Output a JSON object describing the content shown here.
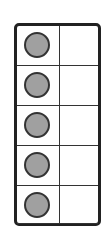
{
  "ten_frame": {
    "columns": 2,
    "rows": 5,
    "filled_count": 5,
    "counter_color": "#a0a0a0",
    "frame_color": "#222222",
    "cells": [
      {
        "row": 1,
        "left": "filled",
        "right": "empty"
      },
      {
        "row": 2,
        "left": "filled",
        "right": "empty"
      },
      {
        "row": 3,
        "left": "filled",
        "right": "empty"
      },
      {
        "row": 4,
        "left": "filled",
        "right": "empty"
      },
      {
        "row": 5,
        "left": "filled",
        "right": "empty"
      }
    ]
  }
}
